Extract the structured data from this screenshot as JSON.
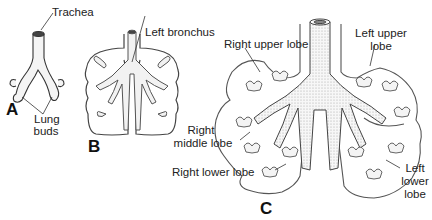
{
  "figure": {
    "panels": [
      {
        "id": "A",
        "label": "A"
      },
      {
        "id": "B",
        "label": "B"
      },
      {
        "id": "C",
        "label": "C"
      }
    ],
    "labels": {
      "trachea": "Trachea",
      "lung_buds_1": "Lung",
      "lung_buds_2": "buds",
      "left_bronchus": "Left bronchus",
      "right_upper_lobe": "Right upper lobe",
      "left_upper_lobe_1": "Left upper",
      "left_upper_lobe_2": "lobe",
      "right_middle_lobe_1": "Right",
      "right_middle_lobe_2": "middle lobe",
      "right_lower_lobe": "Right lower lobe",
      "left_lower_lobe_1": "Left",
      "left_lower_lobe_2": "lower",
      "left_lower_lobe_3": "lobe"
    },
    "colors": {
      "outline": "#333333",
      "fill": "#f2f2f2",
      "stipple": "#888888"
    }
  }
}
